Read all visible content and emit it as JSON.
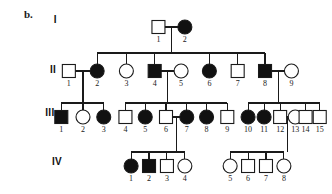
{
  "figure": {
    "panel_label": "b.",
    "type": "pedigree-chart",
    "colors": {
      "affected_fill": "#111111",
      "unaffected_fill": "#ffffff",
      "stroke": "#1a1a1a",
      "background": "#ffffff",
      "text": "#1a1a1a"
    },
    "symbol_legend": {
      "square": "male",
      "circle": "female",
      "filled": "affected",
      "open": "unaffected"
    }
  },
  "generations": [
    {
      "label": "I",
      "label_x": 57,
      "label_y": 14,
      "y": 27,
      "individuals": [
        {
          "id": "1",
          "sex": "male",
          "affected": false,
          "x": 168,
          "num_x": 168,
          "num_y": 42
        },
        {
          "id": "2",
          "sex": "female",
          "affected": true,
          "x": 196,
          "num_x": 196,
          "num_y": 42
        }
      ]
    },
    {
      "label": "II",
      "label_x": 53,
      "label_y": 64,
      "y": 71,
      "individuals": [
        {
          "id": "1",
          "sex": "male",
          "affected": false,
          "x": 73,
          "num_x": 73,
          "num_y": 86
        },
        {
          "id": "2",
          "sex": "female",
          "affected": true,
          "x": 103,
          "num_x": 103,
          "num_y": 86
        },
        {
          "id": "3",
          "sex": "female",
          "affected": false,
          "x": 134,
          "num_x": 134,
          "num_y": 86
        },
        {
          "id": "4",
          "sex": "male",
          "affected": true,
          "x": 164,
          "num_x": 164,
          "num_y": 86
        },
        {
          "id": "5",
          "sex": "female",
          "affected": false,
          "x": 192,
          "num_x": 192,
          "num_y": 86
        },
        {
          "id": "6",
          "sex": "female",
          "affected": true,
          "x": 222,
          "num_x": 222,
          "num_y": 86
        },
        {
          "id": "7",
          "sex": "male",
          "affected": false,
          "x": 252,
          "num_x": 252,
          "num_y": 86
        },
        {
          "id": "8",
          "sex": "male",
          "affected": true,
          "x": 281,
          "num_x": 281,
          "num_y": 86
        },
        {
          "id": "9",
          "sex": "female",
          "affected": false,
          "x": 309,
          "num_x": 309,
          "num_y": 86
        }
      ]
    },
    {
      "label": "III",
      "label_x": 48,
      "label_y": 107,
      "y": 117,
      "individuals": [
        {
          "id": "1",
          "sex": "male",
          "affected": true,
          "x": 65,
          "num_x": 65,
          "num_y": 132
        },
        {
          "id": "2",
          "sex": "female",
          "affected": false,
          "x": 88,
          "num_x": 88,
          "num_y": 132
        },
        {
          "id": "3",
          "sex": "female",
          "affected": true,
          "x": 110,
          "num_x": 110,
          "num_y": 132
        },
        {
          "id": "4",
          "sex": "male",
          "affected": false,
          "x": 133,
          "num_x": 133,
          "num_y": 132
        },
        {
          "id": "5",
          "sex": "female",
          "affected": true,
          "x": 154,
          "num_x": 154,
          "num_y": 132
        },
        {
          "id": "6",
          "sex": "male",
          "affected": false,
          "x": 176,
          "num_x": 176,
          "num_y": 132
        },
        {
          "id": "7",
          "sex": "female",
          "affected": true,
          "x": 198,
          "num_x": 198,
          "num_y": 132
        },
        {
          "id": "8",
          "sex": "female",
          "affected": true,
          "x": 219,
          "num_x": 219,
          "num_y": 132
        },
        {
          "id": "9",
          "sex": "male",
          "affected": false,
          "x": 241,
          "num_x": 241,
          "num_y": 132
        },
        {
          "id": "10",
          "sex": "female",
          "affected": true,
          "x": 263,
          "num_x": 263,
          "num_y": 132
        },
        {
          "id": "11",
          "sex": "female",
          "affected": true,
          "x": 280,
          "num_x": 280,
          "num_y": 132
        },
        {
          "id": "12",
          "sex": "male",
          "affected": false,
          "x": 297,
          "num_x": 297,
          "num_y": 132
        },
        {
          "id": "13",
          "sex": "female",
          "affected": false,
          "x": 313,
          "num_x": 313,
          "num_y": 132
        },
        {
          "id": "14",
          "sex": "male",
          "affected": false,
          "x": 324,
          "num_x": 324,
          "num_y": 132
        },
        {
          "id": "15",
          "sex": "male",
          "affected": false,
          "x": 339,
          "num_x": 339,
          "num_y": 132
        }
      ]
    },
    {
      "label": "IV",
      "label_x": 55,
      "label_y": 156,
      "y": 166,
      "individuals": [
        {
          "id": "1",
          "sex": "female",
          "affected": true,
          "x": 139,
          "num_x": 139,
          "num_y": 181
        },
        {
          "id": "2",
          "sex": "male",
          "affected": true,
          "x": 158,
          "num_x": 158,
          "num_y": 181
        },
        {
          "id": "3",
          "sex": "male",
          "affected": false,
          "x": 177,
          "num_x": 177,
          "num_y": 181
        },
        {
          "id": "4",
          "sex": "female",
          "affected": false,
          "x": 196,
          "num_x": 196,
          "num_y": 181
        },
        {
          "id": "5",
          "sex": "female",
          "affected": false,
          "x": 244,
          "num_x": 244,
          "num_y": 181
        },
        {
          "id": "6",
          "sex": "male",
          "affected": false,
          "x": 263,
          "num_x": 263,
          "num_y": 181
        },
        {
          "id": "7",
          "sex": "male",
          "affected": false,
          "x": 282,
          "num_x": 282,
          "num_y": 181
        },
        {
          "id": "8",
          "sex": "female",
          "affected": false,
          "x": 301,
          "num_x": 301,
          "num_y": 181
        }
      ]
    }
  ],
  "matings": [
    {
      "name": "I-1 x I-2",
      "x1": 168,
      "x2": 196,
      "y": 27,
      "drop_x": 182,
      "drop_y": 53
    },
    {
      "name": "II-1 x II-2",
      "x1": 73,
      "x2": 103,
      "y": 71,
      "drop_x": 88,
      "drop_y": 103
    },
    {
      "name": "II-4 x II-5",
      "x1": 164,
      "x2": 192,
      "y": 71,
      "drop_x": 178,
      "drop_y": 103
    },
    {
      "name": "II-8 x II-9",
      "x1": 281,
      "x2": 309,
      "y": 71,
      "drop_x": 295,
      "drop_y": 103
    },
    {
      "name": "III-6 x III-7",
      "x1": 176,
      "x2": 198,
      "y": 117,
      "drop_x": 187,
      "drop_y": 152
    },
    {
      "name": "III-12 x III-13",
      "x1": 297,
      "x2": 313,
      "y": 117,
      "drop_x": 305,
      "drop_y": 152
    }
  ],
  "sibships": [
    {
      "name": "generation-II-sibship",
      "bus_y": 53,
      "children_x": [
        103,
        134,
        164,
        222,
        252,
        281
      ],
      "child_top_y": 71
    },
    {
      "name": "generation-III-sibship-a",
      "bus_y": 103,
      "children_x": [
        65,
        88,
        110
      ],
      "child_top_y": 117
    },
    {
      "name": "generation-III-sibship-b",
      "bus_y": 103,
      "children_x": [
        133,
        154,
        176,
        198,
        219,
        241
      ],
      "child_top_y": 117
    },
    {
      "name": "generation-III-sibship-c",
      "bus_y": 103,
      "children_x": [
        263,
        280,
        297,
        324,
        339
      ],
      "child_top_y": 117
    },
    {
      "name": "generation-IV-sibship-a",
      "bus_y": 152,
      "children_x": [
        139,
        158,
        177,
        196
      ],
      "child_top_y": 166
    },
    {
      "name": "generation-IV-sibship-b",
      "bus_y": 152,
      "children_x": [
        244,
        263,
        282,
        301
      ],
      "child_top_y": 166
    }
  ],
  "geometry": {
    "square_size": 13,
    "circle_radius": 7,
    "stroke_width": 1.1
  }
}
